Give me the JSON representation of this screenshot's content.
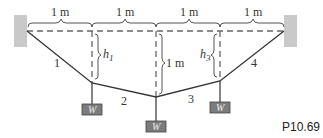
{
  "figure": {
    "id": "P10.69",
    "dimension_labels": [
      "1 m",
      "1 m",
      "1 m",
      "1 m"
    ],
    "sag_labels": {
      "h1": "h",
      "h1_sub": "1",
      "middle": "1 m",
      "h3": "h",
      "h3_sub": "3"
    },
    "segment_labels": [
      "1",
      "2",
      "3",
      "4"
    ],
    "weight_label": "W",
    "colors": {
      "cable": "#333333",
      "dashed": "#666666",
      "weight_fill": "#7a7a7a",
      "wall": "#c8c8c8"
    }
  }
}
